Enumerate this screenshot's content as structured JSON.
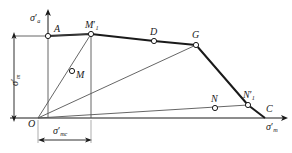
{
  "figure": {
    "type": "engineering-line-diagram",
    "truncated_top_text": "",
    "axes": {
      "y_label": {
        "sym": "σ",
        "prime": "′",
        "sub": "a"
      },
      "x_label": {
        "sym": "σ",
        "prime": "′",
        "sub": "m"
      }
    },
    "origin_label": "O",
    "points": [
      {
        "id": "A",
        "label": "A",
        "sub": "",
        "prime": "",
        "x": 48,
        "y": 36
      },
      {
        "id": "M1p",
        "label": "M",
        "sub": "1",
        "prime": "′",
        "x": 91,
        "y": 34
      },
      {
        "id": "M",
        "label": "M",
        "sub": "",
        "prime": "",
        "x": 72,
        "y": 71
      },
      {
        "id": "D",
        "label": "D",
        "sub": "",
        "prime": "",
        "x": 154,
        "y": 41
      },
      {
        "id": "G",
        "label": "G",
        "sub": "",
        "prime": "",
        "x": 196,
        "y": 45
      },
      {
        "id": "N",
        "label": "N",
        "sub": "",
        "prime": "",
        "x": 215,
        "y": 108
      },
      {
        "id": "N1p",
        "label": "N",
        "sub": "1",
        "prime": "′",
        "x": 248,
        "y": 105
      },
      {
        "id": "C",
        "label": "C",
        "sub": "",
        "prime": "",
        "x": 265,
        "y": 118
      },
      {
        "id": "O",
        "label": "O",
        "sub": "",
        "prime": "",
        "x": 38,
        "y": 118
      }
    ],
    "dimensions": [
      {
        "id": "vertical-dim",
        "sym": "σ",
        "prime": "′",
        "sub": "m",
        "orient": "vertical"
      },
      {
        "id": "horizontal-dim",
        "sym": "σ",
        "prime": "′",
        "sub": "mc",
        "orient": "horizontal"
      }
    ],
    "colors": {
      "stroke": "#1a1a1a",
      "thin": "#555555",
      "background": "#ffffff",
      "marker_fill": "#ffffff"
    }
  }
}
